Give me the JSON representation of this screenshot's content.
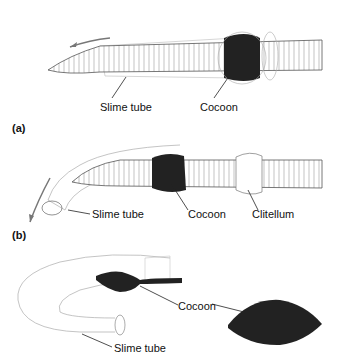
{
  "panels": [
    {
      "id": "a",
      "label": "(a)",
      "annotations": [
        "Slime tube",
        "Cocoon"
      ]
    },
    {
      "id": "b",
      "label": "(b)",
      "annotations": [
        "Slime tube",
        "Cocoon",
        "Clitellum"
      ]
    },
    {
      "id": "c",
      "label": "",
      "annotations": [
        "Cocoon",
        "Slime tube"
      ]
    }
  ],
  "colors": {
    "cocoon": "#222222",
    "outline": "#555555",
    "arrow": "#777777",
    "tube": "#999999"
  }
}
